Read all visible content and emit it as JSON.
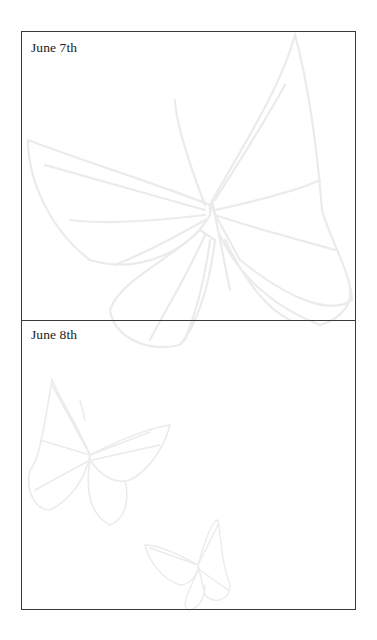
{
  "journal": {
    "entries": [
      {
        "date": "June 7th",
        "content": ""
      },
      {
        "date": "June 8th",
        "content": ""
      }
    ]
  },
  "decorations": {
    "background_icons": [
      "large-butterfly-icon",
      "medium-butterfly-icon",
      "small-butterfly-icon"
    ],
    "outline_color": "#ebebeb",
    "border_color": "#3a3a3a"
  }
}
